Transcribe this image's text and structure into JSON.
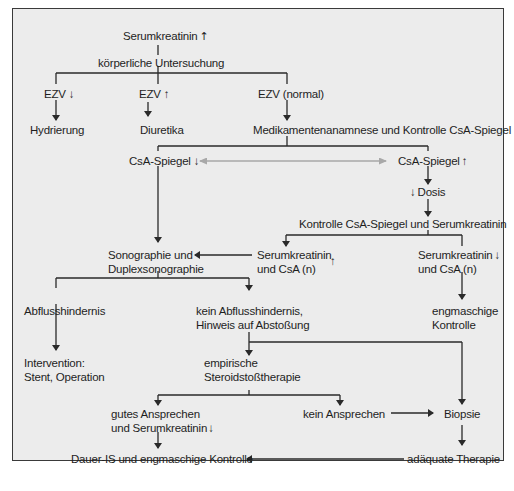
{
  "diagram": {
    "colors": {
      "line": "#2a2a2a",
      "gray_arrow": "#a8a8a8",
      "background": "#ececec",
      "text": "#1e1e1e"
    },
    "nodes": {
      "serumkreatinin_up": {
        "text": "Serumkreatinin",
        "indicator": "up-arrow"
      },
      "koerperliche": {
        "text": "körperliche Untersuchung"
      },
      "ezv_down": {
        "text": "EZV",
        "indicator": "down-arrow"
      },
      "ezv_up": {
        "text": "EZV",
        "indicator": "up-arrow"
      },
      "ezv_normal": {
        "text": "EZV (normal)"
      },
      "hydrierung": {
        "text": "Hydrierung"
      },
      "diuretika": {
        "text": "Diuretika"
      },
      "medikamenten": {
        "text": "Medikamentenanamnese und Kontrolle CsA-Spiegel"
      },
      "csa_down": {
        "text": "CsA-Spiegel",
        "indicator": "down-arrow"
      },
      "csa_up": {
        "text": "CsA-Spiegel",
        "indicator": "up-arrow"
      },
      "dosis": {
        "text": "Dosis",
        "indicator": "down-arrow"
      },
      "kontrolle_csa": {
        "text": "Kontrolle CsA-Spiegel und Serumkreatinin"
      },
      "sono_1": {
        "text": "Sonographie und"
      },
      "sono_2": {
        "text": "Duplexsonographie"
      },
      "serum_csa_up_1": {
        "text": "Serumkreatinin"
      },
      "serum_csa_up_2": {
        "text": "und CsA (n)",
        "indicator": "up-arrow"
      },
      "serum_csa_down_1": {
        "text": "Serumkreatinin",
        "indicator": "down-arrow"
      },
      "serum_csa_down_2": {
        "text": "und CsA (n)"
      },
      "abfluss": {
        "text": "Abflusshindernis"
      },
      "kein_abfluss_1": {
        "text": "kein Abflusshindernis,"
      },
      "kein_abfluss_2": {
        "text": "Hinweis auf Abstoßung"
      },
      "engmaschig_1": {
        "text": "engmaschige"
      },
      "engmaschig_2": {
        "text": "Kontrolle"
      },
      "intervention_1": {
        "text": "Intervention:"
      },
      "intervention_2": {
        "text": "Stent, Operation"
      },
      "empirische_1": {
        "text": "empirische"
      },
      "empirische_2": {
        "text": "Steroidstoßtherapie"
      },
      "gutes_1": {
        "text": "gutes Ansprechen"
      },
      "gutes_2": {
        "text": "und Serumkreatinin",
        "indicator": "down-arrow"
      },
      "kein_ansprechen": {
        "text": "kein Ansprechen"
      },
      "biopsie": {
        "text": "Biopsie"
      },
      "dauer": {
        "text": "Dauer-IS und engmaschige Kontrolle"
      },
      "adaequate": {
        "text": "adäquate Therapie"
      }
    },
    "glyphs": {
      "up": "↑",
      "down": "↓"
    }
  }
}
